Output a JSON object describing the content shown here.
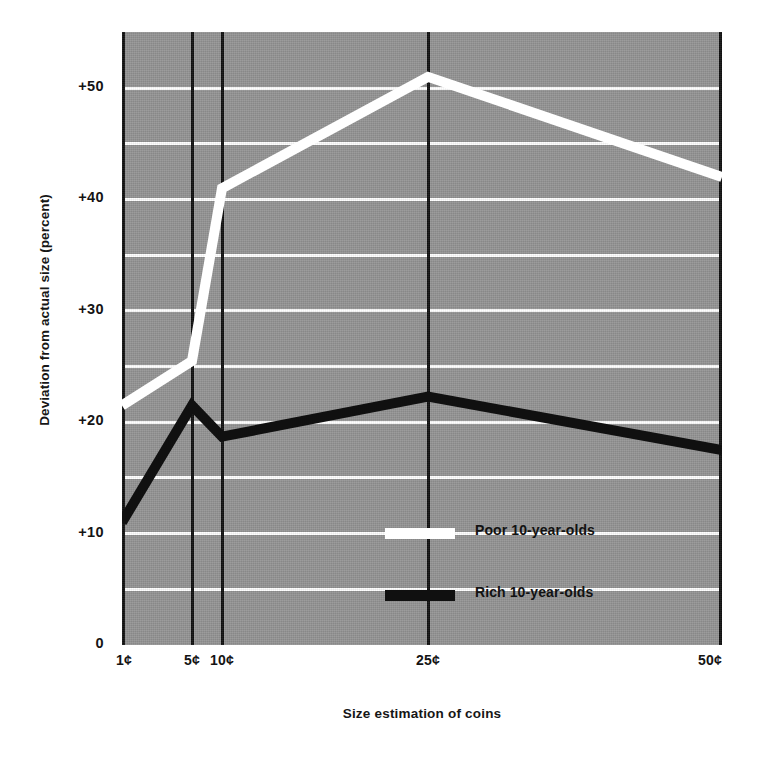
{
  "chart_data": {
    "type": "line",
    "title": "",
    "xlabel": "Size estimation of coins",
    "ylabel": "Deviation from actual size (percent)",
    "categories": [
      "1¢",
      "5¢",
      "10¢",
      "25¢",
      "50¢"
    ],
    "x": [
      1,
      5,
      10,
      25,
      50
    ],
    "series": [
      {
        "name": "Poor 10-year-olds",
        "color": "#ffffff",
        "values": [
          21.5,
          25.5,
          41.0,
          51.0,
          42.0
        ]
      },
      {
        "name": "Rich 10-year-olds",
        "color": "#101010",
        "values": [
          11.0,
          21.5,
          18.7,
          22.3,
          17.5
        ]
      }
    ],
    "ylim": [
      0,
      55
    ],
    "ytick_values": [
      0,
      10,
      20,
      30,
      40,
      50
    ],
    "ytick_labels": [
      "0",
      "+10",
      "+20",
      "+30",
      "+40",
      "+50"
    ],
    "gridline_values": [
      5,
      10,
      15,
      20,
      25,
      30,
      35,
      40,
      45,
      50
    ],
    "grid": true,
    "legend_position": "center",
    "plot_background": "#949494",
    "gridline_color": "#ffffff",
    "axis_line_color": "#101010"
  },
  "axis_titles": {
    "y": "Deviation from actual size (percent)",
    "x": "Size estimation of coins"
  },
  "legend": {
    "entries": [
      {
        "label": "Poor 10-year-olds",
        "color": "#ffffff"
      },
      {
        "label": "Rich 10-year-olds",
        "color": "#101010"
      }
    ]
  },
  "ticks": {
    "y": [
      {
        "label": "+50",
        "value": 50
      },
      {
        "label": "+40",
        "value": 40
      },
      {
        "label": "+30",
        "value": 30
      },
      {
        "label": "+20",
        "value": 20
      },
      {
        "label": "+10",
        "value": 10
      },
      {
        "label": "0",
        "value": 0
      }
    ],
    "x": [
      {
        "label": "1¢",
        "value": 1
      },
      {
        "label": "5¢",
        "value": 5
      },
      {
        "label": "10¢",
        "value": 10
      },
      {
        "label": "25¢",
        "value": 25
      },
      {
        "label": "50¢",
        "value": 50
      }
    ]
  }
}
